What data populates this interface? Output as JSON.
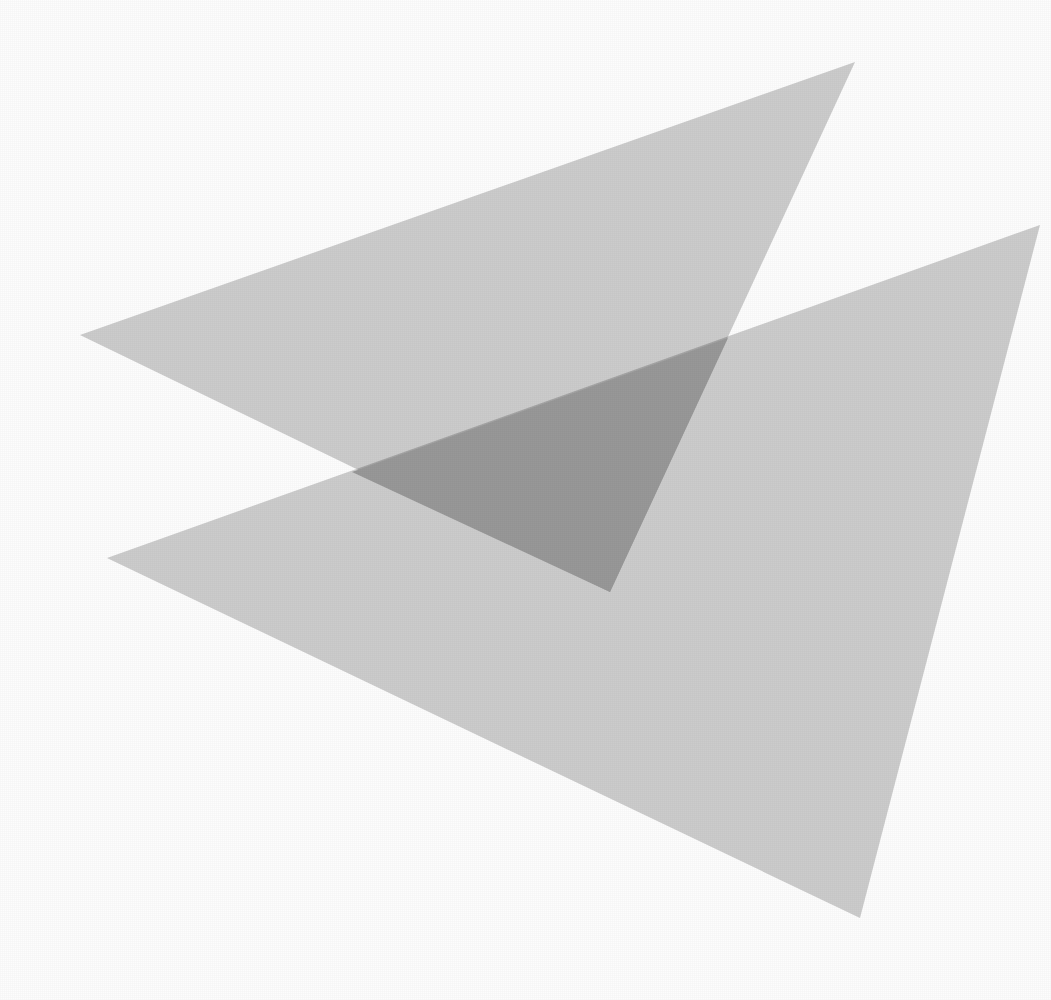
{
  "page": {
    "width": 1051,
    "height": 1000,
    "background_color": "#fdfdfd"
  },
  "palette": {
    "background": "#fdfdfd",
    "shape_fill": "#c0c0c0",
    "overlap_fill": "#989898",
    "shape_opacity": 0.78
  },
  "artwork": {
    "type": "overlapping-translucent-triangles",
    "shape_count": 2,
    "blend_mode": "multiply",
    "shapes": [
      {
        "id": "triangle-upper",
        "name": "Upper Triangle",
        "fill": "#c0c0c0",
        "opacity": 0.78,
        "points": "80,335 855,62 610,592",
        "vertices": [
          {
            "label": "left-tip",
            "x": 80,
            "y": 335
          },
          {
            "label": "top-right",
            "x": 855,
            "y": 62
          },
          {
            "label": "bottom-tip",
            "x": 610,
            "y": 592
          }
        ]
      },
      {
        "id": "triangle-lower",
        "name": "Lower Triangle",
        "fill": "#c0c0c0",
        "opacity": 0.78,
        "points": "107,558 1040,225 860,918",
        "vertices": [
          {
            "label": "left-tip",
            "x": 107,
            "y": 558
          },
          {
            "label": "right-apex",
            "x": 1040,
            "y": 225
          },
          {
            "label": "bottom-tip",
            "x": 860,
            "y": 918
          }
        ]
      }
    ],
    "intersections": [
      {
        "label": "upper-left-crossing",
        "x": 352,
        "y": 472
      },
      {
        "label": "upper-right-crossing",
        "x": 728,
        "y": 338
      },
      {
        "label": "overlap-bottom-tip",
        "x": 610,
        "y": 592
      }
    ],
    "overlap_region": {
      "id": "overlap-wedge",
      "name": "Overlap Wedge",
      "fill": "#989898",
      "points": "352,472 728,338 610,592"
    }
  }
}
